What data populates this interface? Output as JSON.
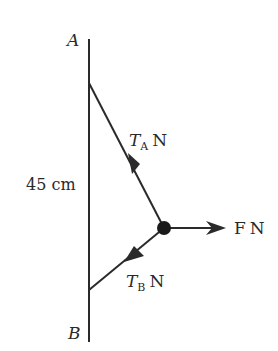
{
  "diagram": {
    "type": "force-diagram",
    "points": {
      "A": {
        "label": "A"
      },
      "B": {
        "label": "B"
      }
    },
    "distance_label": "45 cm",
    "forces": [
      {
        "id": "TA",
        "symbol": "T",
        "subscript": "A",
        "unit": "N",
        "direction": "toward upper attachment on wall (up-left)"
      },
      {
        "id": "TB",
        "symbol": "T",
        "subscript": "B",
        "unit": "N",
        "direction": "toward lower attachment on wall (down-left)"
      },
      {
        "id": "F",
        "symbol": "F",
        "subscript": "",
        "unit": "N",
        "direction": "horizontal right"
      }
    ],
    "colors": {
      "line": "#2a2a2a",
      "node": "#1a1a1a",
      "background": "#ffffff"
    }
  }
}
